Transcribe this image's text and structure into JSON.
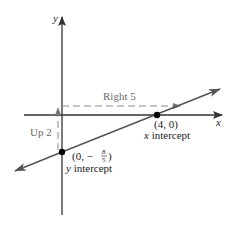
{
  "diagram": {
    "type": "coordinate-plane-line",
    "axes": {
      "x_label": "x",
      "y_label": "y"
    },
    "line": {
      "description": "line through y intercept and x intercept",
      "slope_rise": 2,
      "slope_run": 5
    },
    "points": [
      {
        "name": "x-intercept",
        "coord_text": "(4, 0)",
        "caption": "x intercept",
        "x": 4,
        "y": 0
      },
      {
        "name": "y-intercept",
        "coord_prefix": "(0, −",
        "frac_num": "8",
        "frac_den": "5",
        "coord_suffix": ")",
        "caption": "y intercept",
        "x": 0,
        "y": -1.6
      }
    ],
    "annotations": {
      "right": "Right 5",
      "up": "Up 2"
    },
    "colors": {
      "axis": "#333333",
      "line": "#555555",
      "dashed": "#8a8a8a",
      "point": "#000000"
    }
  }
}
